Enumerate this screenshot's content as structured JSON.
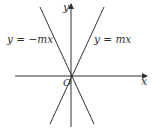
{
  "diagram": {
    "type": "coordinate-plot",
    "axes": {
      "x_label": "x",
      "y_label": "y",
      "origin_label": "O"
    },
    "lines": [
      {
        "name": "positive-slope",
        "label": "y = mx",
        "equation": "y = mx"
      },
      {
        "name": "negative-slope",
        "label": "y = −mx",
        "equation": "y = -mx"
      }
    ],
    "colors": {
      "stroke": "#333333",
      "background": "#ffffff"
    }
  }
}
